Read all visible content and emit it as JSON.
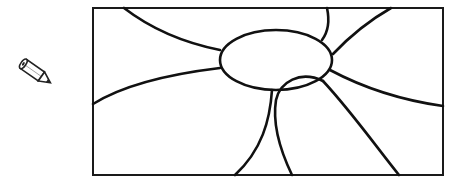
{
  "tool": {
    "icon": "pencil-icon",
    "label": "Draw"
  },
  "drawing": {
    "description": "Line drawing: a central ellipse with curved lines radiating to the frame edges and an overlapping loop below",
    "colors": {
      "line": "#111111",
      "background": "#ffffff",
      "frame": "#1a1a1a"
    }
  }
}
